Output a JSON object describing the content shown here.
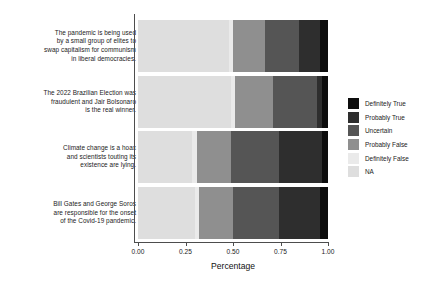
{
  "chart_data": {
    "type": "bar",
    "orientation": "horizontal",
    "stacked": true,
    "normalized": true,
    "title": "",
    "subtitle": "",
    "xlabel": "Percentage",
    "ylabel": "",
    "xlim": [
      0.0,
      1.0
    ],
    "xticks": [
      0.0,
      0.25,
      0.5,
      0.75,
      1.0
    ],
    "xtick_labels": [
      "0.00",
      "0.25",
      "0.50",
      "0.75",
      "1.00"
    ],
    "grid": false,
    "legend_position": "right",
    "legend_title": "",
    "categories": [
      "The pandemic is being used by a small group of elites to swap capitalism for communism in liberal democracies.",
      "The 2022 Brazilian Election was fraudulent and Jair Bolsonaro is the real winner.",
      "Climate change is a hoax and scientists touting its existence are lying.",
      "Bill Gates and George Soros are responsible for the onset of the Covid-19 pandemic."
    ],
    "category_lines": [
      [
        "The pandemic is being used",
        "by a small group of elites to",
        "swap capitalism for communism",
        "in liberal democracies."
      ],
      [
        "The 2022 Brazilian Election was",
        "fraudulent and Jair Bolsonaro",
        "is the real winner."
      ],
      [
        "Climate change is a hoax",
        "and scientists touting its",
        "existence are lying."
      ],
      [
        "Bill Gates and George Soros",
        "are responsible for the onset",
        "of the Covid-19 pandemic."
      ]
    ],
    "series": [
      {
        "name": "NA",
        "color": "#dedede",
        "values": [
          0.48,
          0.49,
          0.285,
          0.3
        ]
      },
      {
        "name": "Definitely False",
        "color": "#eaeaea",
        "values": [
          0.02,
          0.02,
          0.025,
          0.02
        ]
      },
      {
        "name": "Probably False",
        "color": "#8f8f8f",
        "values": [
          0.17,
          0.2,
          0.18,
          0.18
        ]
      },
      {
        "name": "Uncertain",
        "color": "#555555",
        "values": [
          0.18,
          0.23,
          0.25,
          0.24
        ]
      },
      {
        "name": "Probably True",
        "color": "#2e2e2e",
        "values": [
          0.11,
          0.03,
          0.23,
          0.22
        ]
      },
      {
        "name": "Definitely True",
        "color": "#0d0d0d",
        "values": [
          0.04,
          0.03,
          0.03,
          0.04
        ]
      }
    ],
    "legend_entries": [
      {
        "label": "Definitely True",
        "color": "#0d0d0d"
      },
      {
        "label": "Probably True",
        "color": "#2e2e2e"
      },
      {
        "label": "Uncertain",
        "color": "#555555"
      },
      {
        "label": "Probably False",
        "color": "#8f8f8f"
      },
      {
        "label": "Definitely False",
        "color": "#eaeaea"
      },
      {
        "label": "NA",
        "color": "#dedede"
      }
    ],
    "axis_color": "#4d4d4d",
    "background_color": "#ffffff"
  }
}
